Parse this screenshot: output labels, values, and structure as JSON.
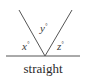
{
  "diagram": {
    "caption": "straight",
    "angles": [
      {
        "var": "x",
        "unit": "°"
      },
      {
        "var": "y",
        "unit": "°"
      },
      {
        "var": "z",
        "unit": "°"
      }
    ],
    "line_color": "#555555"
  }
}
